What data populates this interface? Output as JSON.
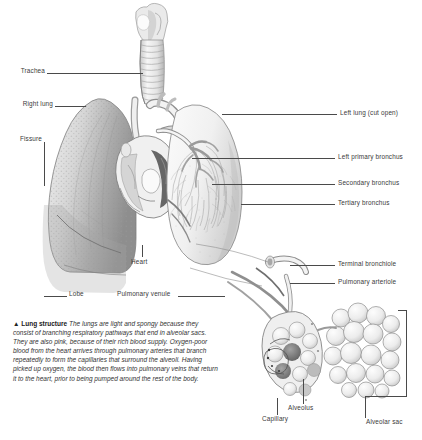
{
  "figure": {
    "title": "Lung structure",
    "marker": "▲",
    "background_color": "#ffffff",
    "label_color": "#3a3a3a",
    "leader_color": "#4a4a4a",
    "caption_body": "The lungs are light and spongy because they consist of branching respiratory pathways that end in alveolar sacs. They are also pink, because of their rich blood supply. Oxygen-poor blood from the heart arrives through pulmonary arteries that branch repeatedly to form the capillaries that surround the alveoli. Having picked up oxygen, the blood then flows into pulmonary veins that return it to the heart, prior to being pumped around the rest of the body."
  },
  "labels_left": [
    {
      "id": "trachea",
      "text": "Trachea"
    },
    {
      "id": "right-lung",
      "text": "Right lung"
    },
    {
      "id": "fissure",
      "text": "Fissure"
    },
    {
      "id": "lobe",
      "text": "Lobe"
    }
  ],
  "labels_center": [
    {
      "id": "heart",
      "text": "Heart"
    },
    {
      "id": "pulmonary-venule",
      "text": "Pulmonary venule"
    },
    {
      "id": "capillary",
      "text": "Capillary"
    },
    {
      "id": "alveolus",
      "text": "Alveolus"
    }
  ],
  "labels_right": [
    {
      "id": "left-lung",
      "text": "Left lung (cut open)"
    },
    {
      "id": "left-primary-bronchus",
      "text": "Left primary bronchus"
    },
    {
      "id": "secondary-bronchus",
      "text": "Secondary bronchus"
    },
    {
      "id": "tertiary-bronchus",
      "text": "Tertiary bronchus"
    },
    {
      "id": "terminal-bronchiole",
      "text": "Terminal bronchiole"
    },
    {
      "id": "pulmonary-arteriole",
      "text": "Pulmonary arteriole"
    },
    {
      "id": "alveolar-sac",
      "text": "Alveolar sac"
    }
  ]
}
